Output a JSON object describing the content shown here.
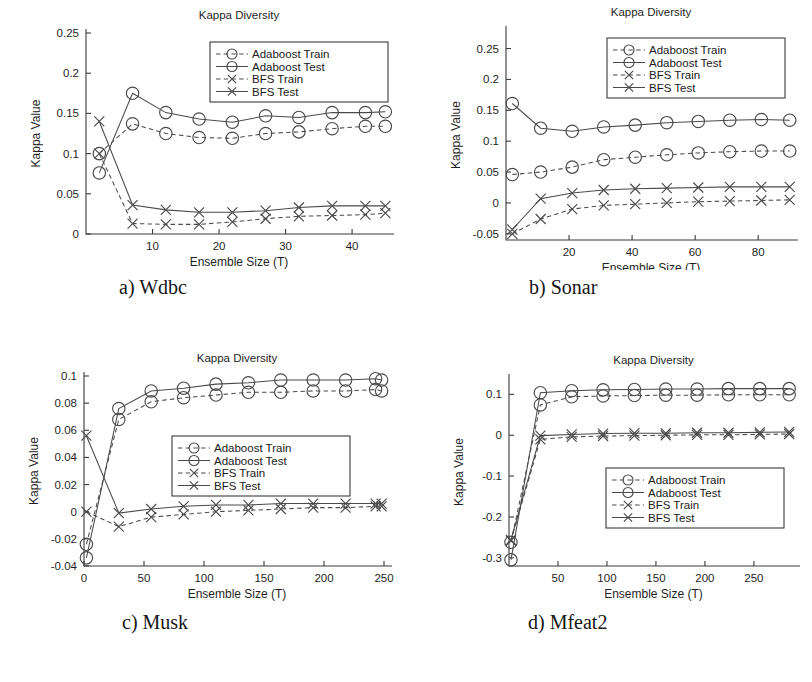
{
  "figure": {
    "panels": [
      {
        "id": "a",
        "caption": "a) Wdbc",
        "chart_data": {
          "type": "line",
          "title": "Kappa Diversity",
          "xlabel": "Ensemble Size (T)",
          "ylabel": "Kappa Value",
          "xlim": [
            0,
            46
          ],
          "ylim": [
            0,
            0.25
          ],
          "xticks": [
            10,
            20,
            30,
            40
          ],
          "yticks": [
            0,
            0.05,
            0.1,
            0.15,
            0.2,
            0.25
          ],
          "ytick_labels": [
            "0",
            "0.05",
            "0.1",
            "0.15",
            "0.2",
            "0.25"
          ],
          "grid": false,
          "legend_position": "top-right",
          "x": [
            2,
            7,
            12,
            17,
            22,
            27,
            32,
            37,
            42,
            45
          ],
          "series": [
            {
              "name": "Adaboost Train",
              "style": "dashed",
              "marker": "circle",
              "values": [
                0.1,
                0.137,
                0.125,
                0.12,
                0.119,
                0.125,
                0.127,
                0.131,
                0.134,
                0.134
              ]
            },
            {
              "name": "Adaboost Test",
              "style": "solid",
              "marker": "circle",
              "values": [
                0.076,
                0.175,
                0.151,
                0.143,
                0.139,
                0.147,
                0.145,
                0.151,
                0.151,
                0.152
              ]
            },
            {
              "name": "BFS Train",
              "style": "dashed",
              "marker": "x",
              "values": [
                0.1,
                0.013,
                0.012,
                0.012,
                0.015,
                0.019,
                0.022,
                0.023,
                0.024,
                0.026
              ]
            },
            {
              "name": "BFS Test",
              "style": "solid",
              "marker": "x",
              "values": [
                0.14,
                0.036,
                0.03,
                0.027,
                0.027,
                0.029,
                0.033,
                0.035,
                0.035,
                0.035
              ]
            }
          ]
        }
      },
      {
        "id": "b",
        "caption": "b) Sonar",
        "chart_data": {
          "type": "line",
          "title": "Kappa Diversity",
          "xlabel": "Ensemble Size (T)",
          "ylabel": "Kappa Value",
          "xlim": [
            0,
            92
          ],
          "ylim": [
            -0.06,
            0.28
          ],
          "xticks": [
            20,
            40,
            60,
            80
          ],
          "yticks": [
            -0.05,
            0,
            0.05,
            0.1,
            0.15,
            0.2,
            0.25
          ],
          "ytick_labels": [
            "-0.05",
            "0",
            "0.05",
            "0.1",
            "0.15",
            "0.2",
            "0.25"
          ],
          "grid": false,
          "legend_position": "top-right",
          "x": [
            2,
            11,
            21,
            31,
            41,
            51,
            61,
            71,
            81,
            90
          ],
          "series": [
            {
              "name": "Adaboost Train",
              "style": "dashed",
              "marker": "circle",
              "values": [
                0.046,
                0.05,
                0.058,
                0.07,
                0.074,
                0.078,
                0.081,
                0.083,
                0.084,
                0.084
              ]
            },
            {
              "name": "Adaboost Test",
              "style": "solid",
              "marker": "circle",
              "values": [
                0.161,
                0.121,
                0.116,
                0.123,
                0.126,
                0.13,
                0.132,
                0.134,
                0.135,
                0.134
              ]
            },
            {
              "name": "BFS Train",
              "style": "dashed",
              "marker": "x",
              "values": [
                -0.05,
                -0.026,
                -0.01,
                -0.004,
                -0.002,
                0.0,
                0.002,
                0.003,
                0.004,
                0.005
              ]
            },
            {
              "name": "BFS Test",
              "style": "solid",
              "marker": "x",
              "values": [
                -0.043,
                0.007,
                0.016,
                0.021,
                0.023,
                0.024,
                0.025,
                0.026,
                0.026,
                0.026
              ]
            }
          ]
        }
      },
      {
        "id": "c",
        "caption": "c) Musk",
        "chart_data": {
          "type": "line",
          "title": "Kappa Diversity",
          "xlabel": "Ensemble Size (T)",
          "ylabel": "Kappa Value",
          "xlim": [
            0,
            255
          ],
          "ylim": [
            -0.04,
            0.1
          ],
          "xticks": [
            0,
            50,
            100,
            150,
            200,
            250
          ],
          "yticks": [
            -0.04,
            -0.02,
            0,
            0.02,
            0.04,
            0.06,
            0.08,
            0.1
          ],
          "ytick_labels": [
            "-0.04",
            "-0.02",
            "0",
            "0.02",
            "0.04",
            "0.06",
            "0.08",
            "0.1"
          ],
          "grid": false,
          "legend_position": "middle-right",
          "x": [
            2,
            29,
            56,
            83,
            110,
            137,
            164,
            191,
            218,
            243,
            248
          ],
          "series": [
            {
              "name": "Adaboost Train",
              "style": "dashed",
              "marker": "circle",
              "values": [
                -0.024,
                0.068,
                0.081,
                0.084,
                0.086,
                0.088,
                0.088,
                0.089,
                0.089,
                0.09,
                0.089
              ]
            },
            {
              "name": "Adaboost Test",
              "style": "solid",
              "marker": "circle",
              "values": [
                -0.034,
                0.076,
                0.089,
                0.091,
                0.094,
                0.095,
                0.097,
                0.097,
                0.097,
                0.098,
                0.097
              ]
            },
            {
              "name": "BFS Train",
              "style": "dashed",
              "marker": "x",
              "values": [
                0.0,
                -0.011,
                -0.004,
                -0.002,
                0.0,
                0.001,
                0.002,
                0.003,
                0.003,
                0.004,
                0.004
              ]
            },
            {
              "name": "BFS Test",
              "style": "solid",
              "marker": "x",
              "values": [
                0.056,
                -0.001,
                0.002,
                0.004,
                0.005,
                0.005,
                0.006,
                0.006,
                0.006,
                0.006,
                0.006
              ]
            }
          ]
        }
      },
      {
        "id": "d",
        "caption": "d) Mfeat2",
        "chart_data": {
          "type": "line",
          "title": "Kappa Diversity",
          "xlabel": "Ensemble Size (T)",
          "ylabel": "Kappa Value",
          "xlim": [
            0,
            295
          ],
          "ylim": [
            -0.32,
            0.14
          ],
          "xticks": [
            50,
            100,
            150,
            200,
            250
          ],
          "yticks": [
            -0.3,
            -0.2,
            -0.1,
            0,
            0.1
          ],
          "ytick_labels": [
            "-0.3",
            "-0.2",
            "-0.1",
            "0",
            "0.1"
          ],
          "grid": false,
          "legend_position": "bottom-right",
          "x": [
            2,
            32,
            64,
            96,
            128,
            160,
            192,
            224,
            256,
            286
          ],
          "series": [
            {
              "name": "Adaboost Train",
              "style": "dashed",
              "marker": "circle",
              "values": [
                -0.262,
                0.074,
                0.094,
                0.096,
                0.097,
                0.098,
                0.098,
                0.099,
                0.099,
                0.099
              ]
            },
            {
              "name": "Adaboost Test",
              "style": "solid",
              "marker": "circle",
              "values": [
                -0.305,
                0.104,
                0.109,
                0.111,
                0.112,
                0.113,
                0.113,
                0.114,
                0.114,
                0.114
              ]
            },
            {
              "name": "BFS Train",
              "style": "dashed",
              "marker": "x",
              "values": [
                -0.258,
                -0.01,
                -0.004,
                -0.002,
                -0.001,
                0.0,
                0.001,
                0.001,
                0.002,
                0.003
              ]
            },
            {
              "name": "BFS Test",
              "style": "solid",
              "marker": "x",
              "values": [
                -0.256,
                -0.001,
                0.002,
                0.004,
                0.005,
                0.005,
                0.006,
                0.006,
                0.007,
                0.008
              ]
            }
          ]
        }
      }
    ]
  },
  "colors": {
    "ink": "#1a1a1a",
    "axis": "#3b3b3b",
    "series": "#4a4a4a",
    "background": "#ffffff"
  }
}
